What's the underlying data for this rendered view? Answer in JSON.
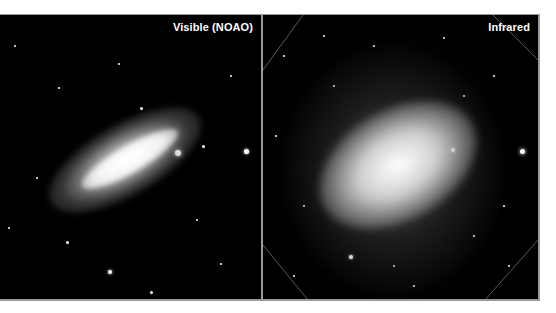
{
  "figure": {
    "panels": [
      {
        "id": "visible",
        "label": "Visible (NOAO)"
      },
      {
        "id": "infrared",
        "label": "Infrared"
      }
    ],
    "colors": {
      "background": "#000000",
      "border": "#9a9a9a",
      "label": "#ffffff"
    }
  }
}
